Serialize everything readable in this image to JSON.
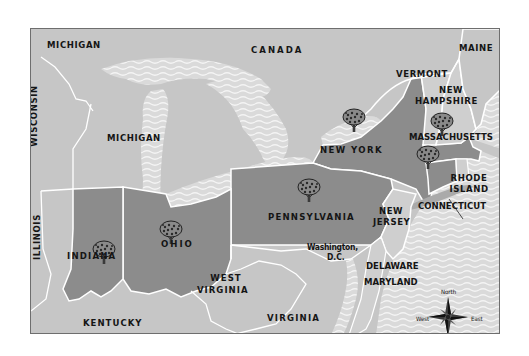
{
  "map": {
    "colors": {
      "highlighted_state": "#8c8c8c",
      "other_land": "#c6c6c6",
      "water": "#dadada",
      "wave": "#f2f2f2",
      "border": "#ffffff",
      "frame": "#6e6e6e",
      "text": "#151515"
    },
    "highlighted_states": [
      "Indiana",
      "Ohio",
      "Pennsylvania",
      "New York",
      "Massachusetts",
      "Connecticut"
    ],
    "tree_icon": "orchard-tree-icon",
    "labels": {
      "michigan_upper": "MICHIGAN",
      "michigan_lower": "MICHIGAN",
      "wisconsin": "WISCONSIN",
      "canada": "CANADA",
      "maine": "MAINE",
      "vermont": "VERMONT",
      "new_hampshire_1": "NEW",
      "new_hampshire_2": "HAMPSHIRE",
      "massachusetts": "MASSACHUSETTS",
      "new_york": "NEW YORK",
      "rhode_island_1": "RHODE",
      "rhode_island_2": "ISLAND",
      "connecticut": "CONNECTICUT",
      "pennsylvania": "PENNSYLVANIA",
      "new_jersey_1": "NEW",
      "new_jersey_2": "JERSEY",
      "illinois": "ILLINOIS",
      "indiana": "INDIANA",
      "ohio": "OHIO",
      "washington_1": "Washington,",
      "washington_2": "D.C.",
      "delaware": "DELAWARE",
      "maryland": "MARYLAND",
      "west_virginia_1": "WEST",
      "west_virginia_2": "VIRGINIA",
      "virginia": "VIRGINIA",
      "kentucky": "KENTUCKY"
    },
    "compass": {
      "icon": "compass-rose-icon",
      "north": "North",
      "south": "South",
      "east": "East",
      "west": "West"
    }
  }
}
